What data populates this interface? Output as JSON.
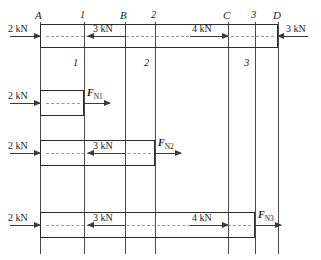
{
  "figure": {
    "width": 321,
    "height": 260,
    "line_color": "#2b2b2b",
    "guide_color": "#9a9a9a"
  },
  "nodes": [
    {
      "id": "A",
      "label": "A",
      "x": 40
    },
    {
      "id": "s1",
      "label": "1",
      "x": 84
    },
    {
      "id": "B",
      "label": "B",
      "x": 125
    },
    {
      "id": "s2",
      "label": "2",
      "x": 155
    },
    {
      "id": "C",
      "label": "C",
      "x": 228
    },
    {
      "id": "s3",
      "label": "3",
      "x": 255
    },
    {
      "id": "D",
      "label": "D",
      "x": 278
    }
  ],
  "section_marks_upper": [
    {
      "label": "1",
      "x": 84
    },
    {
      "label": "2",
      "x": 155
    },
    {
      "label": "3",
      "x": 255
    }
  ],
  "section_marks_lower": [
    {
      "label": "1",
      "x": 84
    },
    {
      "label": "2",
      "x": 155
    },
    {
      "label": "3",
      "x": 255
    }
  ],
  "diagrams": [
    {
      "name": "full-bar",
      "bar": {
        "x1": 40,
        "x2": 278,
        "y1": 24,
        "y2": 48
      },
      "loads": [
        {
          "name": "load-2kn-at-A",
          "label": "2 kN",
          "direction": "right",
          "value": 2,
          "unit": "kN"
        },
        {
          "name": "load-3kn-at-B",
          "label": "3 kN",
          "direction": "left",
          "value": 3,
          "unit": "kN"
        },
        {
          "name": "load-4kn-at-C",
          "label": "4 kN",
          "direction": "right",
          "value": 4,
          "unit": "kN"
        },
        {
          "name": "load-3kn-at-D",
          "label": "3 kN",
          "direction": "left",
          "value": 3,
          "unit": "kN"
        }
      ]
    },
    {
      "name": "segment-A-to-1",
      "bar": {
        "x1": 40,
        "x2": 84,
        "y1": 90,
        "y2": 116
      },
      "loads": [
        {
          "name": "load-2kn-at-A",
          "label": "2 kN",
          "direction": "right",
          "value": 2,
          "unit": "kN"
        }
      ],
      "internal_force": {
        "name": "internal-force-n1",
        "symbol": "F",
        "subscript": "N1",
        "direction": "right"
      }
    },
    {
      "name": "segment-A-to-2",
      "bar": {
        "x1": 40,
        "x2": 155,
        "y1": 140,
        "y2": 166
      },
      "loads": [
        {
          "name": "load-2kn-at-A",
          "label": "2 kN",
          "direction": "right",
          "value": 2,
          "unit": "kN"
        },
        {
          "name": "load-3kn-at-B",
          "label": "3 kN",
          "direction": "left",
          "value": 3,
          "unit": "kN"
        }
      ],
      "internal_force": {
        "name": "internal-force-n2",
        "symbol": "F",
        "subscript": "N2",
        "direction": "right"
      }
    },
    {
      "name": "segment-A-to-3",
      "bar": {
        "x1": 40,
        "x2": 255,
        "y1": 212,
        "y2": 238
      },
      "loads": [
        {
          "name": "load-2kn-at-A",
          "label": "2 kN",
          "direction": "right",
          "value": 2,
          "unit": "kN"
        },
        {
          "name": "load-3kn-at-B",
          "label": "3 kN",
          "direction": "left",
          "value": 3,
          "unit": "kN"
        },
        {
          "name": "load-4kn-at-C",
          "label": "4 kN",
          "direction": "right",
          "value": 4,
          "unit": "kN"
        }
      ],
      "internal_force": {
        "name": "internal-force-n3",
        "symbol": "F",
        "subscript": "N3",
        "direction": "right"
      }
    }
  ],
  "labels": {
    "kn_2": "2 kN",
    "kn_3": "3 kN",
    "kn_4": "4 kN",
    "node_A": "A",
    "node_B": "B",
    "node_C": "C",
    "node_D": "D",
    "sect_1": "1",
    "sect_2": "2",
    "sect_3": "3",
    "fn_symbol": "F",
    "fn1_sub": "N1",
    "fn2_sub": "N2",
    "fn3_sub": "N3"
  }
}
